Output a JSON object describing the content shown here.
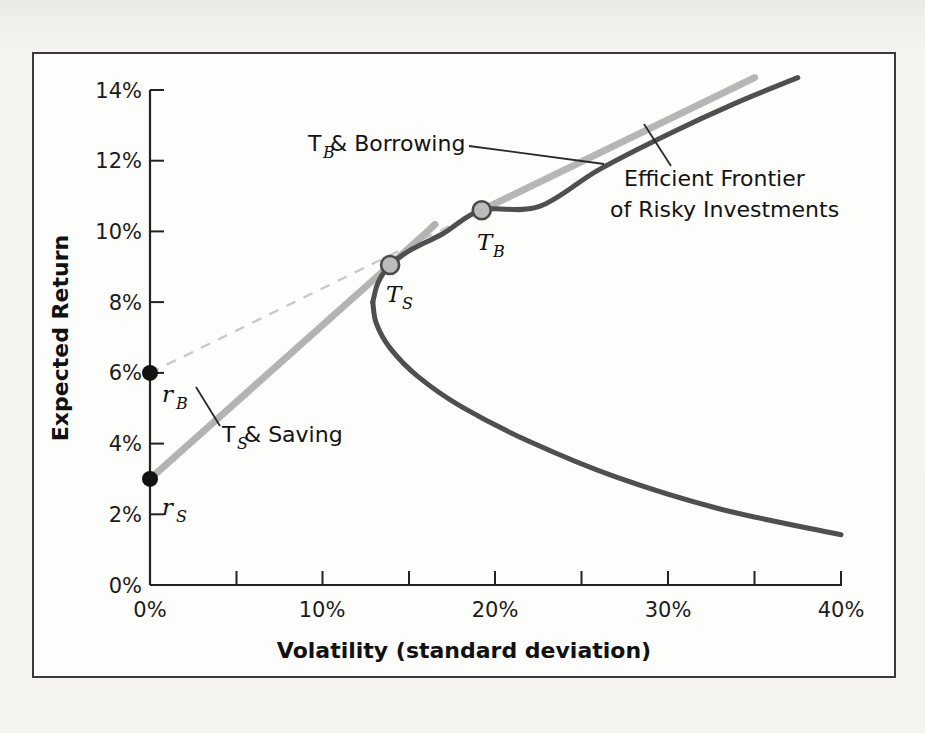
{
  "figure": {
    "background_color": "#f4f3ef",
    "panel_color": "#fdfdfc",
    "frame_color": "#3a3a3a"
  },
  "chart_data": {
    "type": "line",
    "title": "",
    "xlabel": "Volatility (standard deviation)",
    "ylabel": "Expected Return",
    "xlim": [
      0,
      40
    ],
    "ylim": [
      0,
      14
    ],
    "xtick_labels": [
      "0%",
      "10%",
      "20%",
      "30%",
      "40%"
    ],
    "xtick_values": [
      0,
      10,
      20,
      30,
      40
    ],
    "xminor_values": [
      5,
      15,
      25,
      35
    ],
    "ytick_labels": [
      "0%",
      "2%",
      "4%",
      "6%",
      "8%",
      "10%",
      "12%",
      "14%"
    ],
    "ytick_values": [
      0,
      2,
      4,
      6,
      8,
      10,
      12,
      14
    ],
    "grid": false,
    "legend_position": "none",
    "colors": {
      "frontier": "#4d4d4d",
      "saving_line": "#b3b3b3",
      "borrowing_line": "#b8b8b8",
      "borrowing_dashed": "#c7c7c7",
      "marker_fill": "#b9b9b9",
      "marker_edge": "#4a4a4a",
      "rate_dot": "#111111"
    },
    "series": [
      {
        "name": "Efficient Frontier of Risky Investments",
        "style": "solid",
        "color": "#4d4d4d",
        "points": [
          [
            37.5,
            14.35
          ],
          [
            34.0,
            13.65
          ],
          [
            30.0,
            12.75
          ],
          [
            26.0,
            11.75
          ],
          [
            22.5,
            10.7
          ],
          [
            19.2,
            10.6
          ],
          [
            17.0,
            9.95
          ],
          [
            15.0,
            9.45
          ],
          [
            13.9,
            9.05
          ],
          [
            13.2,
            8.55
          ],
          [
            12.9,
            8.0
          ],
          [
            13.1,
            7.4
          ],
          [
            13.9,
            6.7
          ],
          [
            15.5,
            5.9
          ],
          [
            18.0,
            5.05
          ],
          [
            22.0,
            4.05
          ],
          [
            27.0,
            3.05
          ],
          [
            33.0,
            2.15
          ],
          [
            40.0,
            1.42
          ]
        ]
      },
      {
        "name": "T_S & Saving",
        "style": "solid",
        "color": "#b3b3b3",
        "points": [
          [
            0.0,
            3.0
          ],
          [
            13.9,
            9.05
          ],
          [
            16.5,
            10.2
          ]
        ]
      },
      {
        "name": "T_B & Borrowing",
        "style": "solid",
        "color": "#b8b8b8",
        "points": [
          [
            19.2,
            10.6
          ],
          [
            35.0,
            14.35
          ]
        ]
      },
      {
        "name": "Borrowing line (dashed segment)",
        "style": "dashed",
        "color": "#c7c7c7",
        "points": [
          [
            0.0,
            6.0
          ],
          [
            19.2,
            10.6
          ],
          [
            27.5,
            12.6
          ]
        ]
      }
    ],
    "markers": [
      {
        "label": "r_B",
        "label_base": "r",
        "label_sub": "B",
        "x": 0.0,
        "y": 6.0,
        "kind": "filled-dot"
      },
      {
        "label": "r_S",
        "label_base": "r",
        "label_sub": "S",
        "x": 0.0,
        "y": 3.0,
        "kind": "filled-dot"
      },
      {
        "label": "T_S",
        "label_base": "T",
        "label_sub": "S",
        "x": 13.9,
        "y": 9.05,
        "kind": "open-circle"
      },
      {
        "label": "T_B",
        "label_base": "T",
        "label_sub": "B",
        "x": 19.2,
        "y": 10.6,
        "kind": "open-circle"
      }
    ],
    "annotations": [
      {
        "name": "tb-borrowing",
        "text_base": "T",
        "text_sub": "B",
        "text_rest": " & Borrowing",
        "x": 12.0,
        "y": 12.5
      },
      {
        "name": "ts-saving",
        "text_base": "T",
        "text_sub": "S",
        "text_rest": " & Saving",
        "x": 6.2,
        "y": 4.8
      },
      {
        "name": "efficient-frontier",
        "line1": "Efficient Frontier",
        "line2": "of Risky Investments",
        "x": 29.0,
        "y": 11.6
      }
    ]
  },
  "labels": {
    "y_axis_title": "Expected Return",
    "x_axis_title": "Volatility (standard deviation)",
    "tb_borrowing_base": "T",
    "tb_borrowing_sub": "B",
    "tb_borrowing_rest": " & Borrowing",
    "ts_saving_base": "T",
    "ts_saving_sub": "S",
    "ts_saving_rest": " & Saving",
    "efficient_frontier_line1": "Efficient Frontier",
    "efficient_frontier_line2": "of Risky Investments",
    "rb_base": "r",
    "rb_sub": "B",
    "rs_base": "r",
    "rs_sub": "S",
    "ts_base": "T",
    "ts_sub": "S",
    "tb_base": "T",
    "tb_sub": "B",
    "xtick_0": "0%",
    "xtick_1": "10%",
    "xtick_2": "20%",
    "xtick_3": "30%",
    "xtick_4": "40%",
    "ytick_0": "0%",
    "ytick_1": "2%",
    "ytick_2": "4%",
    "ytick_3": "6%",
    "ytick_4": "8%",
    "ytick_5": "10%",
    "ytick_6": "12%",
    "ytick_7": "14%"
  }
}
